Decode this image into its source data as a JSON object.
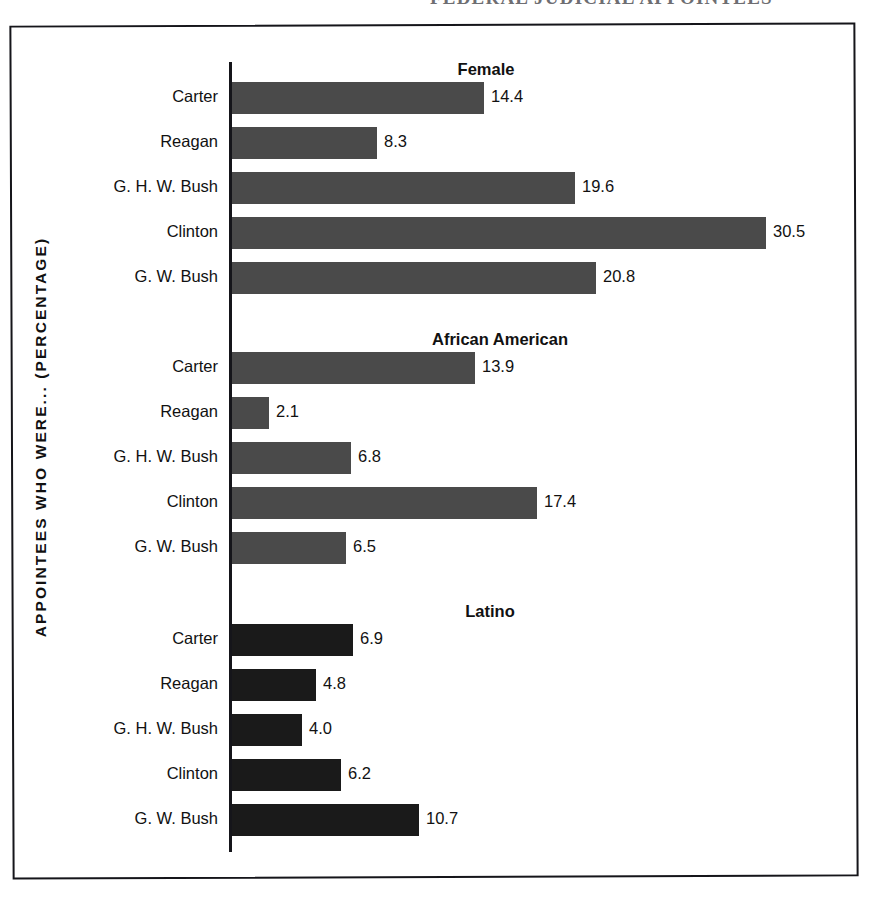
{
  "page": {
    "running_head_fragment": "FEDERAL JUDICIAL APPOINTEES",
    "axis_caption": "APPOINTEES WHO WERE... (PERCENTAGE)"
  },
  "colors": {
    "bar_gray": "#4a4a4a",
    "bar_dark": "#1a1a1a",
    "axis": "#15151a",
    "frame": "#15151a",
    "text": "#111111",
    "background": "#ffffff"
  },
  "chart_data": {
    "type": "bar",
    "orientation": "horizontal",
    "title": "",
    "xlabel": "",
    "ylabel": "APPOINTEES WHO WERE... (PERCENTAGE)",
    "categories": [
      "Carter",
      "Reagan",
      "G. H. W. Bush",
      "Clinton",
      "G. W. Bush"
    ],
    "xlim": [
      0,
      32
    ],
    "grid": false,
    "legend": "none",
    "value_labels": true,
    "px_per_unit": 17.5,
    "groups": [
      {
        "name": "Female",
        "heading": "Female",
        "heading_x": 486,
        "color": "#4a4a4a",
        "values": [
          14.4,
          8.3,
          19.6,
          30.5,
          20.8
        ],
        "value_labels": [
          "14.4",
          "8.3",
          "19.6",
          "30.5",
          "20.8"
        ]
      },
      {
        "name": "African American",
        "heading": "African American",
        "heading_x": 500,
        "color": "#4a4a4a",
        "values": [
          13.9,
          2.1,
          6.8,
          17.4,
          6.5
        ],
        "value_labels": [
          "13.9",
          "2.1",
          "6.8",
          "17.4",
          "6.5"
        ]
      },
      {
        "name": "Latino",
        "heading": "Latino",
        "heading_x": 490,
        "color": "#1a1a1a",
        "values": [
          6.9,
          4.8,
          4.0,
          6.2,
          10.7
        ],
        "value_labels": [
          "6.9",
          "4.8",
          "4.0",
          "6.2",
          "10.7"
        ]
      }
    ]
  },
  "layout": {
    "group_tops": [
      60,
      330,
      602
    ],
    "heading_offset_y": 0,
    "first_row_offset_y": 22,
    "row_pitch": 45,
    "bar_origin_x": 232,
    "bar_height": 32
  }
}
